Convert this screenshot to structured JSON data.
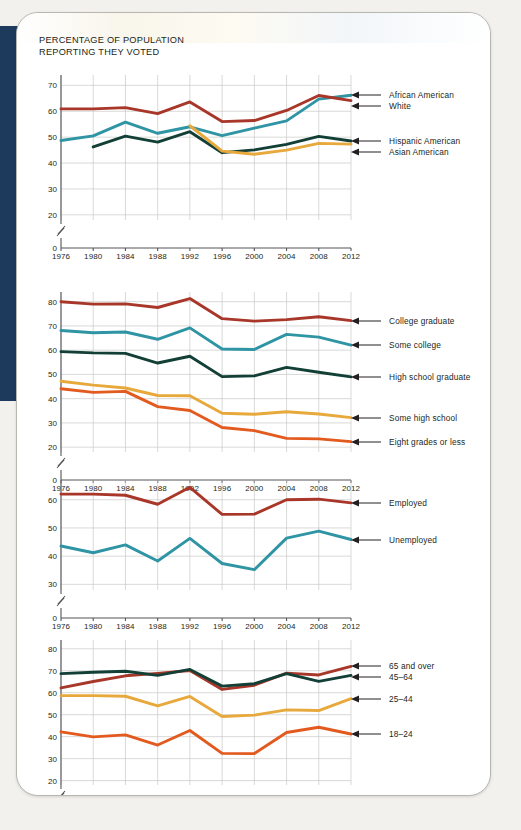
{
  "page": {
    "title_line1": "PERCENTAGE OF POPULATION",
    "title_line2": "REPORTING THEY VOTED",
    "background_color": "#f2f1ee",
    "paper_color": "#ffffff",
    "accent_band_color": "#1d3a5c"
  },
  "palette": {
    "dark_red": "#a8372a",
    "teal": "#2f94a3",
    "dark_green": "#123f36",
    "gold": "#e8a93c",
    "orange": "#e35a1f"
  },
  "chart_data": [
    {
      "type": "line",
      "id": "race-ethnicity",
      "title": "PERCENTAGE OF POPULATION REPORTING THEY VOTED",
      "xlabel": "",
      "ylabel": "",
      "grid": true,
      "legend_position": "right",
      "x": [
        1976,
        1980,
        1984,
        1988,
        1992,
        1996,
        2000,
        2004,
        2008,
        2012
      ],
      "xticklabels": [
        "1976",
        "1980",
        "1984",
        "1988",
        "1992",
        "1996",
        "2000",
        "2004",
        "2008",
        "2012"
      ],
      "yticks": [
        20,
        30,
        40,
        50,
        60,
        70
      ],
      "yticklabels": [
        "20",
        "30",
        "40",
        "50",
        "60",
        "70"
      ],
      "zero_tick": "0",
      "axis_break": true,
      "ylim": [
        18,
        74
      ],
      "series": [
        {
          "name": "African American",
          "color": "#2f94a3",
          "values": [
            48.7,
            50.5,
            55.8,
            51.5,
            54.0,
            50.6,
            53.5,
            56.3,
            64.7,
            66.2
          ]
        },
        {
          "name": "White",
          "color": "#a8372a",
          "values": [
            60.9,
            60.9,
            61.4,
            59.1,
            63.6,
            56.0,
            56.4,
            60.3,
            66.1,
            64.1
          ]
        },
        {
          "name": "Hispanic American",
          "color": "#123f36",
          "values": [
            null,
            46.2,
            50.4,
            48.1,
            52.1,
            44.0,
            45.1,
            47.2,
            50.3,
            48.5
          ],
          "note": "dark green line, begins 1980"
        },
        {
          "name": "Asian American",
          "color": "#e8a93c",
          "values": [
            null,
            null,
            null,
            null,
            54.4,
            44.6,
            43.4,
            45.0,
            47.6,
            47.3
          ],
          "note": "gold line, begins 1992"
        }
      ]
    },
    {
      "type": "line",
      "id": "education",
      "grid": true,
      "legend_position": "right",
      "x": [
        1976,
        1980,
        1984,
        1988,
        1992,
        1996,
        2000,
        2004,
        2008,
        2012
      ],
      "xticklabels": [
        "1976",
        "1980",
        "1984",
        "1988",
        "1992",
        "1996",
        "2000",
        "2004",
        "2008",
        "2012"
      ],
      "yticks": [
        20,
        30,
        40,
        50,
        60,
        70,
        80
      ],
      "yticklabels": [
        "20",
        "30",
        "40",
        "50",
        "60",
        "70",
        "80"
      ],
      "zero_tick": "0",
      "axis_break": true,
      "ylim": [
        18,
        84
      ],
      "series": [
        {
          "name": "College graduate",
          "color": "#a8372a",
          "values": [
            80.0,
            79.0,
            79.1,
            77.6,
            81.3,
            73.0,
            72.0,
            72.6,
            73.8,
            72.2
          ]
        },
        {
          "name": "Some college",
          "color": "#2f94a3",
          "values": [
            68.1,
            67.2,
            67.5,
            64.5,
            69.2,
            60.5,
            60.3,
            66.5,
            65.4,
            62.1
          ]
        },
        {
          "name": "High school graduate",
          "color": "#123f36",
          "values": [
            59.4,
            58.9,
            58.7,
            54.7,
            57.5,
            49.1,
            49.4,
            52.9,
            50.9,
            49.0
          ]
        },
        {
          "name": "Some high school",
          "color": "#e8a93c",
          "values": [
            47.2,
            45.6,
            44.4,
            41.3,
            41.2,
            34.0,
            33.6,
            34.6,
            33.7,
            32.2
          ]
        },
        {
          "name": "Eight grades or less",
          "color": "#e35a1f",
          "values": [
            44.1,
            42.6,
            43.0,
            36.7,
            35.1,
            28.1,
            26.8,
            23.6,
            23.4,
            22.3
          ]
        }
      ]
    },
    {
      "type": "line",
      "id": "employment-status",
      "grid": true,
      "legend_position": "right",
      "x": [
        1976,
        1980,
        1984,
        1988,
        1992,
        1996,
        2000,
        2004,
        2008,
        2012
      ],
      "xticklabels": [
        "1976",
        "1980",
        "1984",
        "1988",
        "1992",
        "1996",
        "2000",
        "2004",
        "2008",
        "2012"
      ],
      "yticks": [
        30,
        40,
        50,
        60
      ],
      "yticklabels": [
        "30",
        "40",
        "50",
        "60"
      ],
      "zero_tick": "0",
      "axis_break": true,
      "ylim": [
        28,
        67
      ],
      "series": [
        {
          "name": "Employed",
          "color": "#a8372a",
          "values": [
            62.0,
            62.0,
            61.6,
            58.4,
            64.4,
            54.8,
            54.9,
            60.0,
            60.2,
            58.9
          ]
        },
        {
          "name": "Unemployed",
          "color": "#2f94a3",
          "values": [
            43.6,
            41.2,
            44.0,
            38.3,
            46.3,
            37.4,
            35.2,
            46.4,
            48.9,
            45.9
          ]
        }
      ]
    },
    {
      "type": "line",
      "id": "age-group",
      "grid": true,
      "legend_position": "right",
      "x": [
        1976,
        1980,
        1984,
        1988,
        1992,
        1996,
        2000,
        2004,
        2008,
        2012
      ],
      "xticklabels": [
        "1976",
        "1980",
        "1984",
        "1988",
        "1992",
        "1996",
        "2000",
        "2004",
        "2008",
        "2012"
      ],
      "yticks": [
        20,
        30,
        40,
        50,
        60,
        70,
        80
      ],
      "yticklabels": [
        "20",
        "30",
        "40",
        "50",
        "60",
        "70",
        "80"
      ],
      "zero_tick": "0",
      "axis_break": true,
      "ylim": [
        18,
        84
      ],
      "series": [
        {
          "name": "65 and over",
          "color": "#a8372a",
          "values": [
            62.2,
            65.1,
            67.7,
            68.8,
            70.1,
            61.5,
            63.4,
            68.9,
            68.1,
            72.0
          ]
        },
        {
          "name": "45–64",
          "color": "#123f36",
          "values": [
            68.7,
            69.3,
            69.8,
            67.9,
            70.6,
            63.0,
            64.1,
            68.7,
            65.2,
            67.9
          ]
        },
        {
          "name": "25–44",
          "color": "#e8a93c",
          "values": [
            58.7,
            58.7,
            58.4,
            54.0,
            58.3,
            49.2,
            49.8,
            52.2,
            51.9,
            57.3
          ]
        },
        {
          "name": "18–24",
          "color": "#e35a1f",
          "values": [
            42.2,
            39.9,
            40.8,
            36.2,
            42.8,
            32.4,
            32.3,
            41.9,
            44.3,
            41.2
          ]
        }
      ]
    }
  ]
}
